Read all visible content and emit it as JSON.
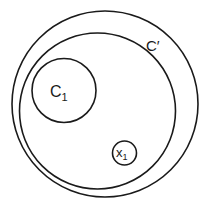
{
  "diagram": {
    "type": "nested-sets",
    "stroke_color": "#1a1a1a",
    "background": "#ffffff",
    "shapes": [
      {
        "id": "outer-set",
        "label": "",
        "cx": 105,
        "cy": 104,
        "r": 93
      },
      {
        "id": "c-prime",
        "label": "C′",
        "cx": 97.5,
        "cy": 111,
        "r": 78
      },
      {
        "id": "c1",
        "label": "C",
        "subscript": "1",
        "cx": 64,
        "cy": 90.5,
        "r": 32
      },
      {
        "id": "x1",
        "label": "x",
        "subscript": "1",
        "cx": 124.5,
        "cy": 153,
        "r": 12
      }
    ],
    "labels": {
      "c_prime": "C′",
      "c1_main": "C",
      "c1_sub": "1",
      "x1_main": "x",
      "x1_sub": "1"
    }
  }
}
